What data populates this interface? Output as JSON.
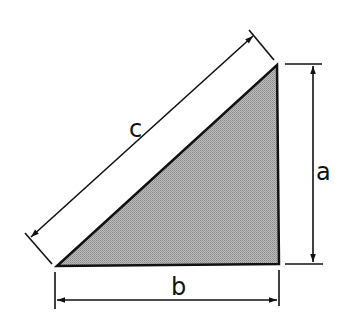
{
  "diagram": {
    "type": "right-triangle",
    "labels": {
      "hypotenuse": "c",
      "vertical_side": "a",
      "horizontal_side": "b"
    },
    "colors": {
      "fill": "#a8a8a8",
      "stroke": "#111111",
      "background": "#ffffff"
    }
  }
}
